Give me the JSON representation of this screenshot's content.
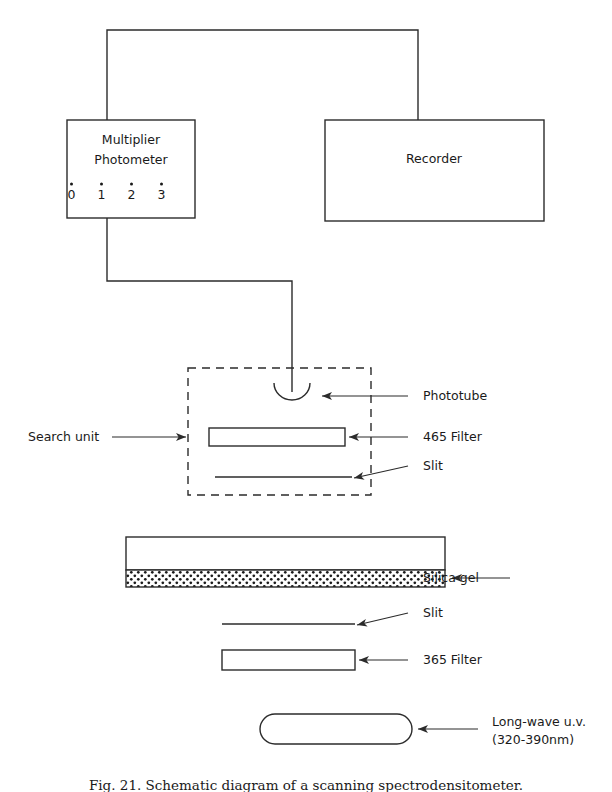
{
  "figure": {
    "caption": "Fig. 21. Schematic diagram of a scanning spectrodensitometer.",
    "instruments": {
      "photometer": {
        "line1": "Multiplier",
        "line2": "Photometer",
        "dial_values": [
          "0",
          "1",
          "2",
          "3"
        ]
      },
      "recorder": {
        "label": "Recorder"
      }
    },
    "search_unit": {
      "label": "Search unit",
      "components": [
        {
          "name": "phototube",
          "label": "Phototube"
        },
        {
          "name": "filter-465",
          "label": "465 Filter"
        },
        {
          "name": "slit-upper",
          "label": "Slit"
        }
      ]
    },
    "optical_train": [
      {
        "name": "silica-gel",
        "label": "Silica gel"
      },
      {
        "name": "slit-lower",
        "label": "Slit"
      },
      {
        "name": "filter-365",
        "label": "365 Filter"
      },
      {
        "name": "uv-lamp",
        "label_line1": "Long-wave u.v.",
        "label_line2": "(320-390nm)"
      }
    ],
    "colors": {
      "ink": "#2b2b2b",
      "paper": "#ffffff",
      "stipple": "#1a1a1a"
    }
  }
}
